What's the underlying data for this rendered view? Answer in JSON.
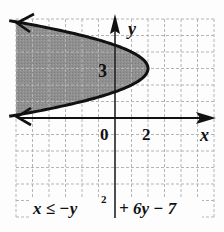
{
  "chart_data": {
    "type": "inequality-graph",
    "title": "",
    "inequality": "x ≤ −y² + 6y − 7",
    "boundary": {
      "equation": "x = -y^2 + 6y - 7",
      "vertex": [
        2,
        3
      ],
      "opens": "left",
      "line_style": "solid"
    },
    "shading": "inside (left of parabola)",
    "xlabel": "x",
    "ylabel": "y",
    "xlim": [
      -6,
      6
    ],
    "ylim": [
      -6,
      6
    ],
    "grid": true,
    "grid_step": 1,
    "tick_labels": {
      "x": [
        "0",
        "2"
      ],
      "y": [
        "3"
      ]
    },
    "colors": {
      "shade": "#8e8e8e",
      "curve": "#111111",
      "grid": "#b8b8b8",
      "axis": "#222222"
    }
  },
  "labels": {
    "x_axis": "x",
    "y_axis": "y",
    "origin": "0",
    "x_tick_2": "2",
    "y_tick_3": "3",
    "equation_lhs": "x ≤ −y",
    "equation_exp": "2",
    "equation_rhs": "+ 6y − 7"
  }
}
